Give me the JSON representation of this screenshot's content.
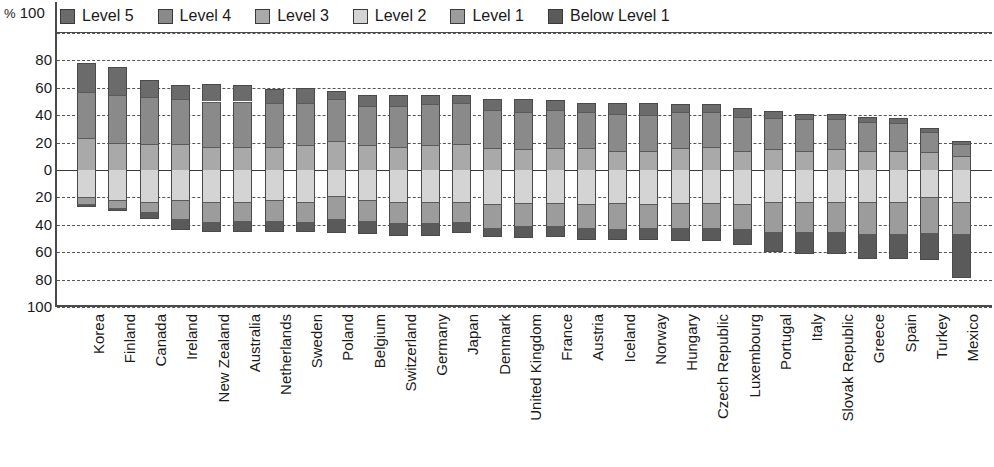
{
  "axis": {
    "unit_symbol": "%",
    "unit_max": "100",
    "y_ticks_up": [
      "80",
      "60",
      "40",
      "20",
      "0"
    ],
    "y_ticks_down": [
      "20",
      "40",
      "60",
      "80",
      "100"
    ]
  },
  "legend": {
    "items": [
      {
        "label": "Level 5",
        "color": "#6b6b6b"
      },
      {
        "label": "Level 4",
        "color": "#8a8a8a"
      },
      {
        "label": "Level 3",
        "color": "#a9a9a9"
      },
      {
        "label": "Level 2",
        "color": "#d4d4d4"
      },
      {
        "label": "Level 1",
        "color": "#9c9c9c"
      },
      {
        "label": "Below Level 1",
        "color": "#5a5a5a"
      }
    ]
  },
  "chart_data": {
    "type": "bar",
    "subtype": "diverging-stacked",
    "title": "",
    "xlabel": "",
    "ylabel": "%",
    "ylim": [
      -100,
      100
    ],
    "grid": true,
    "legend_position": "top",
    "series_order_up": [
      "Level 3",
      "Level 4",
      "Level 5"
    ],
    "series_order_down": [
      "Level 2",
      "Level 1",
      "Below Level 1"
    ],
    "colors": {
      "Level 5": "#6b6b6b",
      "Level 4": "#8a8a8a",
      "Level 3": "#a9a9a9",
      "Level 2": "#d4d4d4",
      "Level 1": "#9c9c9c",
      "Below Level 1": "#5a5a5a"
    },
    "categories": [
      "Korea",
      "Finland",
      "Canada",
      "Ireland",
      "New Zealand",
      "Australia",
      "Netherlands",
      "Sweden",
      "Poland",
      "Belgium",
      "Switzerland",
      "Germany",
      "Japan",
      "Denmark",
      "United Kingdom",
      "France",
      "Austria",
      "Iceland",
      "Norway",
      "Hungary",
      "Czech Republic",
      "Luxembourg",
      "Portugal",
      "Italy",
      "Slovak Republic",
      "Greece",
      "Spain",
      "Turkey",
      "Mexico"
    ],
    "series": [
      {
        "name": "Level 5",
        "values": [
          21,
          20,
          13,
          10,
          13,
          12,
          10,
          11,
          6,
          8,
          8,
          7,
          6,
          8,
          10,
          7,
          7,
          8,
          9,
          6,
          6,
          6,
          5,
          4,
          4,
          4,
          4,
          3,
          2
        ]
      },
      {
        "name": "Level 4",
        "values": [
          34,
          35,
          34,
          33,
          33,
          33,
          32,
          31,
          31,
          29,
          30,
          30,
          30,
          28,
          27,
          28,
          26,
          27,
          26,
          26,
          25,
          25,
          23,
          23,
          22,
          21,
          20,
          15,
          9
        ]
      },
      {
        "name": "Level 3",
        "values": [
          23,
          20,
          19,
          19,
          17,
          17,
          17,
          18,
          21,
          18,
          17,
          18,
          19,
          16,
          15,
          16,
          16,
          14,
          14,
          16,
          17,
          14,
          15,
          14,
          15,
          14,
          14,
          13,
          10
        ]
      },
      {
        "name": "Level 2",
        "values": [
          20,
          22,
          23,
          22,
          23,
          23,
          22,
          23,
          19,
          22,
          23,
          23,
          23,
          25,
          24,
          24,
          25,
          24,
          25,
          24,
          24,
          25,
          23,
          23,
          23,
          23,
          23,
          20,
          23
        ]
      },
      {
        "name": "Level 1",
        "values": [
          5,
          6,
          8,
          14,
          15,
          14,
          15,
          15,
          17,
          15,
          16,
          16,
          15,
          17,
          17,
          17,
          17,
          19,
          17,
          18,
          18,
          18,
          22,
          22,
          22,
          24,
          24,
          26,
          24
        ]
      },
      {
        "name": "Below Level 1",
        "values": [
          2,
          2,
          5,
          8,
          7,
          8,
          8,
          7,
          10,
          10,
          9,
          9,
          8,
          7,
          9,
          8,
          9,
          8,
          9,
          10,
          10,
          12,
          15,
          16,
          16,
          18,
          18,
          20,
          32
        ]
      }
    ]
  }
}
